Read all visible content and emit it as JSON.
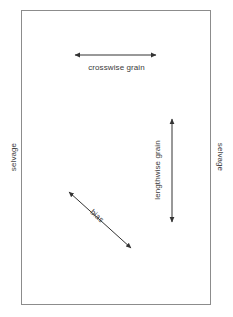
{
  "diagram": {
    "background_color": "#ffffff",
    "fabric": {
      "name": "fabric-rectangle",
      "border_color": "#8c8c8c",
      "fill_color": "#ffffff",
      "x": 21,
      "y": 10,
      "width": 190,
      "height": 295
    },
    "arrow_color": "#333333",
    "text_color": "#3a3a3a",
    "labels": {
      "crosswise_grain": "crosswise grain",
      "lengthwise_grain": "lengthwise grain",
      "bias": "bias",
      "selvage_left": "selvage",
      "selvage_right": "selvage"
    },
    "arrows": [
      {
        "name": "crosswise-grain-arrow",
        "label": "crosswise grain",
        "orientation": "horizontal",
        "double_headed": true,
        "x1": 73,
        "y1": 55,
        "x2": 158,
        "y2": 55
      },
      {
        "name": "lengthwise-grain-arrow",
        "label": "lengthwise grain",
        "orientation": "vertical",
        "double_headed": true,
        "x1": 172,
        "y1": 117,
        "x2": 172,
        "y2": 224
      },
      {
        "name": "bias-arrow",
        "label": "bias",
        "orientation": "diagonal",
        "double_headed": true,
        "x1": 67,
        "y1": 190,
        "x2": 133,
        "y2": 250
      }
    ]
  }
}
